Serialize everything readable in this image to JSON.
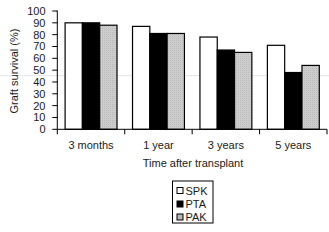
{
  "chart_data": {
    "type": "bar",
    "title": "",
    "xlabel": "Time after transplant",
    "ylabel": "Graft survival (%)",
    "categories": [
      "3 months",
      "1 year",
      "3 years",
      "5 years"
    ],
    "series": [
      {
        "name": "SPK",
        "values": [
          90,
          87,
          78,
          71
        ],
        "fill": "#ffffff",
        "stroke": "#000000"
      },
      {
        "name": "PTA",
        "values": [
          90,
          81,
          67,
          48
        ],
        "fill": "#000000",
        "stroke": "#000000"
      },
      {
        "name": "PAK",
        "values": [
          88,
          81,
          65,
          54
        ],
        "fill": "#c8c8c8",
        "stroke": "#000000"
      }
    ],
    "ylim": [
      0,
      100
    ],
    "yticks": [
      "0",
      "10",
      "20",
      "30",
      "40",
      "50",
      "60",
      "70",
      "80",
      "90",
      "100"
    ],
    "grid": false,
    "legend": {
      "position": "bottom-center",
      "boxed": true,
      "entries": [
        "SPK",
        "PTA",
        "PAK"
      ]
    }
  }
}
